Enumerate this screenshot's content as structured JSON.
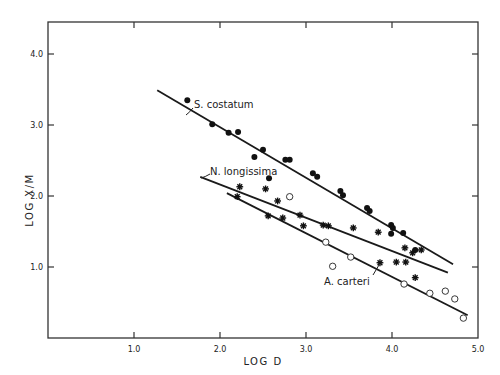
{
  "chart_data": {
    "type": "scatter",
    "title": "",
    "xlabel": "LOG D",
    "ylabel": "LOG X/M",
    "xlim": [
      0,
      5.0
    ],
    "ylim": [
      0,
      4.5
    ],
    "xticks": [
      "1.0",
      "2.0",
      "3.0",
      "4.0",
      "5.0"
    ],
    "yticks": [
      "1.0",
      "2.0",
      "3.0",
      "4.0"
    ],
    "grid": false,
    "legend": "inline annotations",
    "series": [
      {
        "name": "S. costatum",
        "marker": "filled-circle",
        "points": [
          [
            1.62,
            3.35
          ],
          [
            1.91,
            3.01
          ],
          [
            2.1,
            2.89
          ],
          [
            2.21,
            2.9
          ],
          [
            2.4,
            2.55
          ],
          [
            2.5,
            2.65
          ],
          [
            2.57,
            2.25
          ],
          [
            2.76,
            2.51
          ],
          [
            2.81,
            2.51
          ],
          [
            3.08,
            2.32
          ],
          [
            3.13,
            2.27
          ],
          [
            3.4,
            2.07
          ],
          [
            3.43,
            2.01
          ],
          [
            3.71,
            1.83
          ],
          [
            3.74,
            1.79
          ],
          [
            3.99,
            1.59
          ],
          [
            4.01,
            1.55
          ],
          [
            3.99,
            1.47
          ],
          [
            4.13,
            1.48
          ],
          [
            4.27,
            1.24
          ]
        ],
        "fit_line": [
          [
            1.27,
            3.49
          ],
          [
            4.71,
            1.04
          ]
        ]
      },
      {
        "name": "N. longissima",
        "marker": "asterisk",
        "points": [
          [
            2.23,
            2.13
          ],
          [
            2.53,
            2.1
          ],
          [
            2.67,
            1.93
          ],
          [
            2.2,
            1.99
          ],
          [
            2.56,
            1.72
          ],
          [
            2.73,
            1.69
          ],
          [
            2.93,
            1.73
          ],
          [
            2.97,
            1.58
          ],
          [
            3.2,
            1.59
          ],
          [
            3.26,
            1.58
          ],
          [
            3.55,
            1.55
          ],
          [
            3.84,
            1.49
          ],
          [
            4.15,
            1.27
          ],
          [
            4.24,
            1.2
          ],
          [
            4.34,
            1.24
          ],
          [
            3.86,
            1.06
          ],
          [
            4.05,
            1.07
          ],
          [
            4.16,
            1.07
          ],
          [
            4.27,
            0.85
          ]
        ],
        "fit_line": [
          [
            1.77,
            2.27
          ],
          [
            4.65,
            0.92
          ]
        ]
      },
      {
        "name": "A. carteri",
        "marker": "open-circle",
        "points": [
          [
            2.81,
            1.99
          ],
          [
            3.23,
            1.35
          ],
          [
            3.31,
            1.01
          ],
          [
            3.52,
            1.14
          ],
          [
            4.14,
            0.76
          ],
          [
            4.44,
            0.63
          ],
          [
            4.62,
            0.66
          ],
          [
            4.73,
            0.55
          ],
          [
            4.83,
            0.28
          ]
        ],
        "fit_line": [
          [
            2.08,
            2.04
          ],
          [
            4.88,
            0.32
          ]
        ]
      }
    ],
    "annotations": [
      {
        "text": "S. costatum",
        "target_series": 0
      },
      {
        "text": "N. longissima",
        "target_series": 1
      },
      {
        "text": "A. carteri",
        "target_series": 2
      }
    ]
  },
  "labels": {
    "xlabel": "LOG D",
    "ylabel": "LOG X/M",
    "ann_s": "S. costatum",
    "ann_n": "N. longissima",
    "ann_a": "A. carteri"
  }
}
